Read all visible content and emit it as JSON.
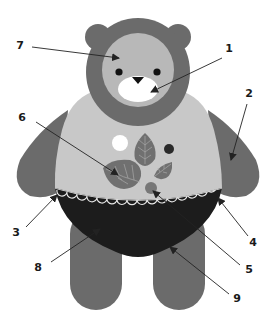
{
  "diagram": {
    "colors": {
      "background": "#ffffff",
      "fur_dark": "#6b6b6b",
      "face_light": "#b8b8b8",
      "body_light": "#c8c8c8",
      "muzzle": "#ffffff",
      "eyes_nose": "#111111",
      "pants": "#1c1c1c",
      "lace_trim": "#e6e6e6",
      "leaf": "#707070",
      "leaf_vein": "#a8a8a8",
      "dot_white": "#ffffff",
      "dot_black": "#2a2a2a",
      "dot_grey": "#777777",
      "callout_line": "#222222"
    },
    "callouts": [
      {
        "number": "1",
        "target": "muzzle",
        "label_x": 229,
        "label_y": 52,
        "from_x": 222,
        "from_y": 58,
        "to_x": 151,
        "to_y": 92
      },
      {
        "number": "2",
        "target": "right-arm",
        "label_x": 249,
        "label_y": 97,
        "from_x": 247,
        "from_y": 104,
        "to_x": 231,
        "to_y": 160
      },
      {
        "number": "3",
        "target": "lace-trim-left",
        "label_x": 16,
        "label_y": 236,
        "from_x": 26,
        "from_y": 227,
        "to_x": 57,
        "to_y": 195
      },
      {
        "number": "4",
        "target": "lace-trim-right",
        "label_x": 253,
        "label_y": 246,
        "from_x": 248,
        "from_y": 236,
        "to_x": 218,
        "to_y": 198
      },
      {
        "number": "5",
        "target": "grey-dot",
        "label_x": 249,
        "label_y": 273,
        "from_x": 240,
        "from_y": 265,
        "to_x": 153,
        "to_y": 191
      },
      {
        "number": "6",
        "target": "leaf",
        "label_x": 22,
        "label_y": 121,
        "from_x": 36,
        "from_y": 122,
        "to_x": 118,
        "to_y": 175
      },
      {
        "number": "7",
        "target": "face",
        "label_x": 20,
        "label_y": 49,
        "from_x": 32,
        "from_y": 47,
        "to_x": 119,
        "to_y": 58
      },
      {
        "number": "8",
        "target": "pants",
        "label_x": 38,
        "label_y": 271,
        "from_x": 51,
        "from_y": 262,
        "to_x": 100,
        "to_y": 229
      },
      {
        "number": "9",
        "target": "pants-bottom-edge",
        "label_x": 237,
        "label_y": 302,
        "from_x": 229,
        "from_y": 294,
        "to_x": 170,
        "to_y": 247
      }
    ]
  }
}
